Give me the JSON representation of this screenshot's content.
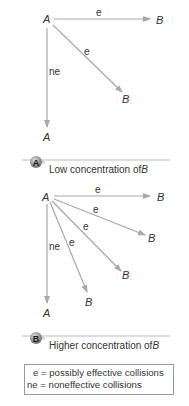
{
  "colors": {
    "arrow": "#a8a8a8",
    "text": "#333333",
    "badge_fill": "#8c8c8c",
    "badge_highlight": "#d8d8d8",
    "rule": "#bdbdbd",
    "legend_border": "#9a9a9a"
  },
  "panel_low": {
    "badge_letter": "A",
    "caption_prefix": "Low concentration of ",
    "caption_species": "B",
    "origin_label": "A",
    "arrows": [
      {
        "label": "e",
        "target": "B",
        "kind": "effective"
      },
      {
        "label": "e",
        "target": "B",
        "kind": "effective"
      },
      {
        "label": "ne",
        "target": "A",
        "kind": "noneffective"
      }
    ]
  },
  "panel_high": {
    "badge_letter": "B",
    "caption_prefix": "Higher concentration of ",
    "caption_species": "B",
    "origin_label": "A",
    "arrows": [
      {
        "label": "e",
        "target": "B",
        "kind": "effective"
      },
      {
        "label": "e",
        "target": "B",
        "kind": "effective"
      },
      {
        "label": "e",
        "target": "B",
        "kind": "effective"
      },
      {
        "label": "e",
        "target": "B",
        "kind": "effective"
      },
      {
        "label": "ne",
        "target": "A",
        "kind": "noneffective"
      }
    ]
  },
  "legend": {
    "line1": "  e = possibly effective collisions",
    "line2": "ne = noneffective collisions"
  }
}
